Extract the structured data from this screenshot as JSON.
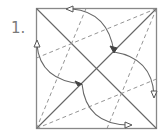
{
  "diagram": {
    "type": "origami-crease-pattern",
    "step_label": "1.",
    "colors": {
      "line": "#666666",
      "label": "#7a7a7a"
    },
    "square": {
      "x": 36,
      "y": 8,
      "size": 120
    },
    "creases": {
      "valley_solid": [
        "diagonal TL-BR",
        "diagonal BL-TR"
      ],
      "dashed": [
        "BL to top edge",
        "BL to right edge",
        "TR to left edge",
        "TR to bottom edge"
      ]
    },
    "arrows": [
      {
        "from": "top edge",
        "to": "diagonal point upper-right"
      },
      {
        "from": "right edge",
        "to": "diagonal point upper-right"
      },
      {
        "from": "left edge",
        "to": "diagonal point lower-left"
      },
      {
        "from": "bottom edge",
        "to": "diagonal point lower-left"
      }
    ]
  }
}
